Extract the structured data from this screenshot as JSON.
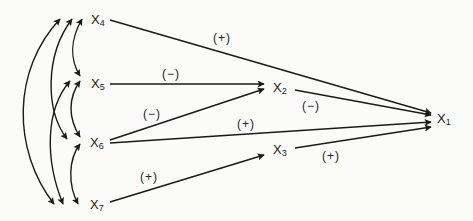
{
  "diagram": {
    "type": "path-diagram",
    "nodes": [
      {
        "id": "X4",
        "base": "X",
        "sub": "4",
        "x": 91,
        "y": 13
      },
      {
        "id": "X5",
        "base": "X",
        "sub": "5",
        "x": 91,
        "y": 77
      },
      {
        "id": "X6",
        "base": "X",
        "sub": "6",
        "x": 90,
        "y": 138
      },
      {
        "id": "X7",
        "base": "X",
        "sub": "7",
        "x": 90,
        "y": 198
      },
      {
        "id": "X2",
        "base": "X",
        "sub": "2",
        "x": 273,
        "y": 81
      },
      {
        "id": "X3",
        "base": "X",
        "sub": "3",
        "x": 273,
        "y": 143
      },
      {
        "id": "X1",
        "base": "X",
        "sub": "1",
        "x": 437,
        "y": 112
      }
    ],
    "paths": [
      {
        "from": "X4",
        "to": "X1",
        "sign": "(+)",
        "label_x": 213,
        "label_y": 32
      },
      {
        "from": "X5",
        "to": "X2",
        "sign": "(−)",
        "label_x": 162,
        "label_y": 70
      },
      {
        "from": "X6",
        "to": "X2",
        "sign": "(−)",
        "label_x": 143,
        "label_y": 110
      },
      {
        "from": "X2",
        "to": "X1",
        "sign": "(−)",
        "label_x": 302,
        "label_y": 101
      },
      {
        "from": "X6",
        "to": "X1",
        "sign": "(+)",
        "label_x": 237,
        "label_y": 121
      },
      {
        "from": "X7",
        "to": "X3",
        "sign": "(+)",
        "label_x": 140,
        "label_y": 171
      },
      {
        "from": "X3",
        "to": "X1",
        "sign": "(+)",
        "label_x": 322,
        "label_y": 150
      }
    ],
    "correlations": [
      {
        "a": "X4",
        "b": "X5"
      },
      {
        "a": "X4",
        "b": "X6"
      },
      {
        "a": "X4",
        "b": "X7"
      },
      {
        "a": "X5",
        "b": "X6"
      },
      {
        "a": "X5",
        "b": "X7"
      },
      {
        "a": "X6",
        "b": "X7"
      }
    ]
  },
  "labels": {
    "x4": {
      "base": "X",
      "sub": "4"
    },
    "x5": {
      "base": "X",
      "sub": "5"
    },
    "x6": {
      "base": "X",
      "sub": "6"
    },
    "x7": {
      "base": "X",
      "sub": "7"
    },
    "x2": {
      "base": "X",
      "sub": "2"
    },
    "x3": {
      "base": "X",
      "sub": "3"
    },
    "x1": {
      "base": "X",
      "sub": "1"
    },
    "sign_x4_x1": "(+)",
    "sign_x5_x2": "(−)",
    "sign_x6_x2": "(−)",
    "sign_x2_x1": "(−)",
    "sign_x6_x1": "(+)",
    "sign_x7_x3": "(+)",
    "sign_x3_x1": "(+)"
  }
}
